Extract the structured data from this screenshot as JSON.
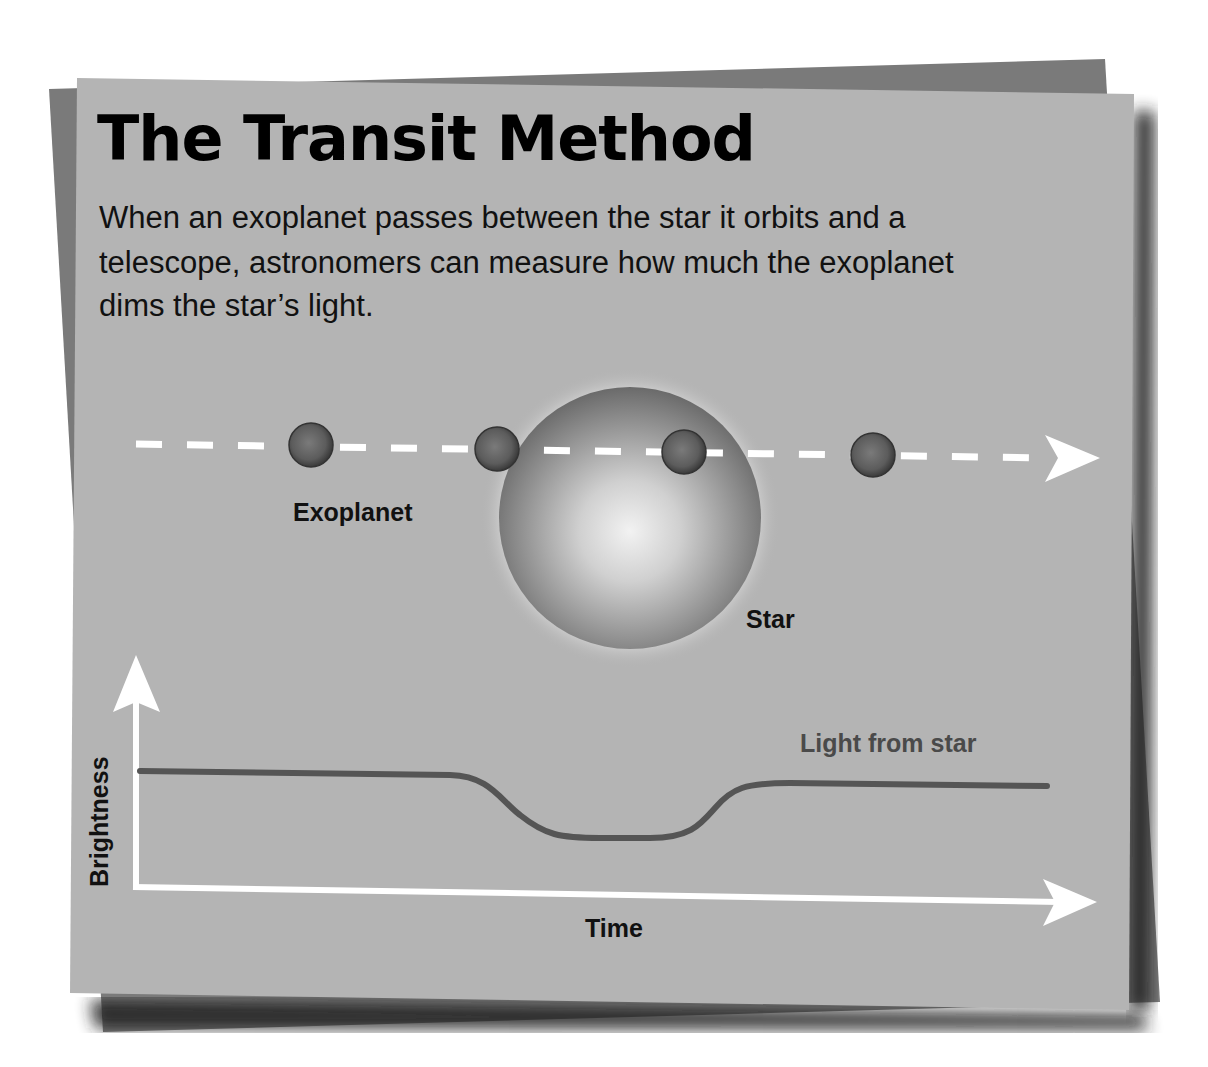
{
  "title": "The Transit Method",
  "description": {
    "lines": [
      "When an exoplanet passes between the star it orbits and a",
      "telescope, astronomers can measure how much the exoplanet",
      "dims the star’s light."
    ]
  },
  "diagram": {
    "exoplanet_label": "Exoplanet",
    "star_label": "Star",
    "planet_count": 4,
    "orbit_path": "dashed-arrow"
  },
  "graph": {
    "y_axis_label": "Brightness",
    "x_axis_label": "Time",
    "curve_label": "Light from star"
  },
  "colors": {
    "card_front": "#b4b4b4",
    "card_back": "#7a7a7a",
    "shadow": "#2a2a2a",
    "curve": "#555555",
    "axis": "#ffffff",
    "planet": "#5a5a5a"
  }
}
